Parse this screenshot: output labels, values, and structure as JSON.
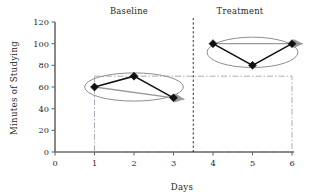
{
  "chart_data": {
    "type": "line",
    "title": "",
    "xlabel": "Days",
    "ylabel": "Minutes of Studying",
    "xlim": [
      0,
      6
    ],
    "ylim": [
      0,
      120
    ],
    "xticks": [
      0,
      1,
      2,
      3,
      4,
      5,
      6
    ],
    "yticks": [
      0,
      20,
      40,
      60,
      80,
      100,
      120
    ],
    "xtick_labels": [
      "0",
      "1",
      "2",
      "3",
      "4",
      "5",
      "6"
    ],
    "ytick_labels": [
      "0",
      "20",
      "40",
      "60",
      "80",
      "100",
      "120"
    ],
    "grid": false,
    "legend": "none",
    "x": [
      1,
      2,
      3,
      4,
      5,
      6
    ],
    "values": [
      60,
      70,
      50,
      100,
      80,
      100
    ],
    "series": [
      {
        "name": "Baseline",
        "x": [
          1,
          2,
          3
        ],
        "values": [
          60,
          70,
          50
        ]
      },
      {
        "name": "Treatment",
        "x": [
          4,
          5,
          6
        ],
        "values": [
          100,
          80,
          100
        ]
      }
    ],
    "annotations": {
      "phase_labels": [
        {
          "text": "Baseline",
          "x": 2
        },
        {
          "text": "Treatment",
          "x": 5
        }
      ],
      "phase_divider_x": 3.5,
      "trend_arrows": [
        {
          "phase": "Baseline",
          "from": [
            1,
            60
          ],
          "to": [
            3,
            50
          ]
        },
        {
          "phase": "Treatment",
          "from": [
            4,
            100
          ],
          "to": [
            6,
            100
          ]
        }
      ],
      "envelope_ellipses": [
        {
          "phase": "Baseline",
          "center": [
            2,
            60
          ],
          "rx": 1.25,
          "ry": 13
        },
        {
          "phase": "Treatment",
          "center": [
            5,
            92
          ],
          "rx": 1.15,
          "ry": 14
        }
      ],
      "reference_rect": {
        "x0": 1,
        "x1": 6,
        "y0": 0,
        "y1": 70
      }
    }
  },
  "labels": {
    "baseline": "Baseline",
    "treatment": "Treatment",
    "x_axis_title": "Days",
    "y_axis_title": "Minutes of Studying"
  }
}
